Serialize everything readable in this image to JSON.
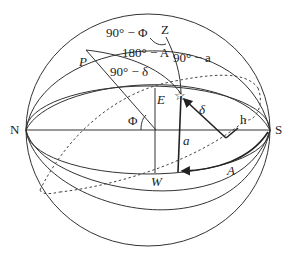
{
  "diagram": {
    "labels": {
      "north": "N",
      "south": "S",
      "zenith": "Z",
      "pole": "P",
      "east": "E",
      "west": "W",
      "colatitude": "90° − Φ",
      "angle_180_minus_A": "180° − A",
      "codeclination": "90° − δ",
      "coaltitude": "90° − a",
      "latitude": "Φ",
      "declination": "δ",
      "hour_angle": "h",
      "altitude": "a",
      "azimuth": "A"
    },
    "star_symbol": "☆",
    "colors": {
      "line": "#333333",
      "text": "#222222",
      "background": "#ffffff"
    }
  }
}
